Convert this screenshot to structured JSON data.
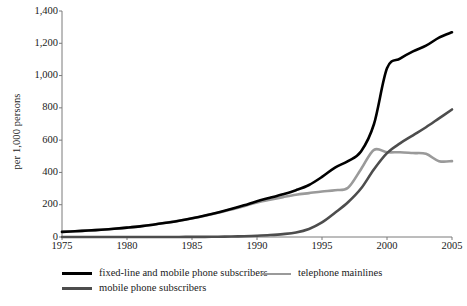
{
  "chart_data": {
    "type": "line",
    "title": "",
    "subtitle": "",
    "xlabel": "",
    "ylabel": "per 1,000 persons",
    "xlim": [
      1975,
      2005
    ],
    "ylim": [
      0,
      1400
    ],
    "grid": false,
    "legend_position": "bottom",
    "xticks": [
      "1975",
      "1980",
      "1985",
      "1990",
      "1995",
      "2000",
      "2005"
    ],
    "xtick_values": [
      1975,
      1980,
      1985,
      1990,
      1995,
      2000,
      2005
    ],
    "yticks": [
      "0",
      "200",
      "400",
      "600",
      "800",
      "1,000",
      "1,200",
      "1,400"
    ],
    "ytick_values": [
      0,
      200,
      400,
      600,
      800,
      1000,
      1200,
      1400
    ],
    "x": [
      1975,
      1976,
      1977,
      1978,
      1979,
      1980,
      1981,
      1982,
      1983,
      1984,
      1985,
      1986,
      1987,
      1988,
      1989,
      1990,
      1991,
      1992,
      1993,
      1994,
      1995,
      1996,
      1997,
      1998,
      1999,
      2000,
      2001,
      2002,
      2003,
      2004,
      2005
    ],
    "series": [
      {
        "name": "fixed-line and mobile phone subscribers",
        "color": "#000000",
        "width": 2.6,
        "values": [
          32,
          36,
          40,
          45,
          51,
          58,
          66,
          76,
          88,
          101,
          116,
          133,
          152,
          173,
          196,
          222,
          243,
          265,
          290,
          322,
          372,
          430,
          470,
          530,
          700,
          1045,
          1105,
          1150,
          1185,
          1235,
          1268
        ]
      },
      {
        "name": "mobile phone subscribers",
        "color": "#4d4d4d",
        "width": 2.6,
        "values": [
          0,
          0,
          0,
          0,
          0,
          0,
          0,
          0,
          0,
          0,
          1,
          1,
          2,
          3,
          5,
          8,
          12,
          18,
          28,
          50,
          90,
          150,
          215,
          300,
          420,
          520,
          580,
          630,
          680,
          735,
          790
        ]
      },
      {
        "name": "telephone mainlines",
        "color": "#9a9a9a",
        "width": 2.6,
        "values": [
          32,
          36,
          40,
          45,
          51,
          58,
          66,
          76,
          88,
          101,
          115,
          132,
          150,
          170,
          191,
          214,
          231,
          247,
          262,
          272,
          282,
          290,
          305,
          420,
          540,
          525,
          525,
          520,
          515,
          470,
          470
        ]
      }
    ]
  },
  "axis": {
    "y_label": "per 1,000 persons"
  },
  "legend": {
    "items": [
      {
        "label": "fixed-line and mobile phone subscribers",
        "color": "#000000"
      },
      {
        "label": "mobile phone subscribers",
        "color": "#4d4d4d"
      },
      {
        "label": "telephone mainlines",
        "color": "#9a9a9a"
      }
    ]
  }
}
